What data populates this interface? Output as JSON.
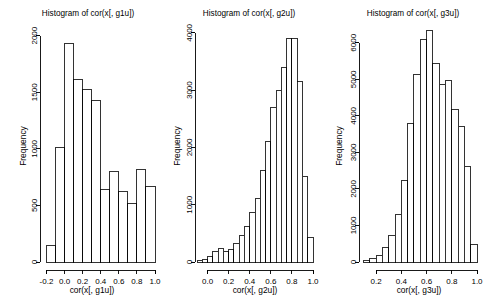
{
  "figure": {
    "background": "#ffffff",
    "foreground": "#000000",
    "panel_count": 3,
    "layout": "1 row x 3 columns"
  },
  "chart_data": [
    {
      "type": "bar",
      "subtype": "histogram",
      "title": "Histogram of cor(x[, g1u])",
      "xlabel": "cor(x[, g1u])",
      "ylabel": "Frequency",
      "xlim": [
        -0.25,
        1.0
      ],
      "ylim": [
        0,
        2050
      ],
      "xticks": [
        "-0.2",
        "0.0",
        "0.2",
        "0.4",
        "0.6",
        "0.8",
        "1.0"
      ],
      "xtick_values": [
        -0.2,
        0.0,
        0.2,
        0.4,
        0.6,
        0.8,
        1.0
      ],
      "yticks": [
        "0",
        "500",
        "1000",
        "1500",
        "2000"
      ],
      "ytick_values": [
        0,
        500,
        1000,
        1500,
        2000
      ],
      "grid": false,
      "legend": false,
      "bin_width": 0.1,
      "bin_edges": [
        -0.2,
        -0.1,
        0.0,
        0.1,
        0.2,
        0.3,
        0.4,
        0.5,
        0.6,
        0.7,
        0.8,
        0.9,
        1.0
      ],
      "bin_centers": [
        -0.15,
        -0.05,
        0.05,
        0.15,
        0.25,
        0.35,
        0.45,
        0.55,
        0.65,
        0.75,
        0.85,
        0.95
      ],
      "values": [
        150,
        1010,
        1930,
        1610,
        1520,
        1430,
        640,
        800,
        620,
        520,
        820,
        670
      ]
    },
    {
      "type": "bar",
      "subtype": "histogram",
      "title": "Histogram of cor(x[, g2u])",
      "xlabel": "cor(x[, g2u])",
      "ylabel": "Frequency",
      "xlim": [
        -0.1,
        1.0
      ],
      "ylim": [
        0,
        4050
      ],
      "xticks": [
        "0.0",
        "0.2",
        "0.4",
        "0.6",
        "0.8",
        "1.0"
      ],
      "xtick_values": [
        0.0,
        0.2,
        0.4,
        0.6,
        0.8,
        1.0
      ],
      "yticks": [
        "0",
        "1000",
        "2000",
        "3000",
        "4000"
      ],
      "ytick_values": [
        0,
        1000,
        2000,
        3000,
        4000
      ],
      "grid": false,
      "legend": false,
      "bin_width": 0.05,
      "bin_edges": [
        -0.1,
        -0.05,
        0.0,
        0.05,
        0.1,
        0.15,
        0.2,
        0.25,
        0.3,
        0.35,
        0.4,
        0.45,
        0.5,
        0.55,
        0.6,
        0.65,
        0.7,
        0.75,
        0.8,
        0.85,
        0.9,
        0.95,
        1.0
      ],
      "bin_centers": [
        -0.075,
        -0.025,
        0.025,
        0.075,
        0.125,
        0.175,
        0.225,
        0.275,
        0.325,
        0.375,
        0.425,
        0.475,
        0.525,
        0.575,
        0.625,
        0.675,
        0.725,
        0.775,
        0.825,
        0.875,
        0.925,
        0.975
      ],
      "values": [
        20,
        40,
        90,
        180,
        230,
        190,
        210,
        330,
        470,
        620,
        860,
        1100,
        1600,
        2100,
        2700,
        3000,
        3400,
        3900,
        3900,
        3150,
        1500,
        420
      ]
    },
    {
      "type": "bar",
      "subtype": "histogram",
      "title": "Histogram of cor(x[, g3u])",
      "xlabel": "cor(x[, g3u])",
      "ylabel": "Frequency",
      "xlim": [
        0.08,
        1.0
      ],
      "ylim": [
        0,
        6350
      ],
      "xticks": [
        "0.2",
        "0.4",
        "0.6",
        "0.8",
        "1.0"
      ],
      "xtick_values": [
        0.2,
        0.4,
        0.6,
        0.8,
        1.0
      ],
      "yticks": [
        "0",
        "1000",
        "2000",
        "3000",
        "4000",
        "5000",
        "6000"
      ],
      "ytick_values": [
        0,
        1000,
        2000,
        3000,
        4000,
        5000,
        6000
      ],
      "grid": false,
      "legend": false,
      "bin_width": 0.05,
      "bin_edges": [
        0.1,
        0.15,
        0.2,
        0.25,
        0.3,
        0.35,
        0.4,
        0.45,
        0.5,
        0.55,
        0.6,
        0.65,
        0.7,
        0.75,
        0.8,
        0.85,
        0.9,
        0.95,
        1.0
      ],
      "bin_centers": [
        0.125,
        0.175,
        0.225,
        0.275,
        0.325,
        0.375,
        0.425,
        0.475,
        0.525,
        0.575,
        0.625,
        0.675,
        0.725,
        0.775,
        0.825,
        0.875,
        0.925,
        0.975
      ],
      "values": [
        40,
        90,
        180,
        400,
        720,
        1300,
        2220,
        3780,
        5120,
        6080,
        6350,
        5420,
        4870,
        4980,
        4170,
        3720,
        2620,
        480
      ]
    }
  ]
}
